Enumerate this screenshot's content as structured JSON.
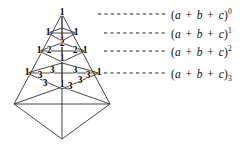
{
  "figure": {
    "background_color": "#ffffff",
    "line_color": "#333333",
    "text_color": "#111111"
  },
  "equation_labels": [
    {
      "id": "row-0",
      "base": "(a + b + c)",
      "exponent": "0",
      "exponent_style": "superscript",
      "x": 171,
      "y": 9
    },
    {
      "id": "row-1",
      "base": "(a + b + c)",
      "exponent": "1",
      "exponent_style": "superscript",
      "x": 171,
      "y": 28
    },
    {
      "id": "row-2",
      "base": "(a + b + c)",
      "exponent": "2",
      "exponent_style": "superscript",
      "x": 171,
      "y": 46
    },
    {
      "id": "row-3",
      "base": "(a + b + c)",
      "exponent": "3",
      "exponent_style": "subscript",
      "x": 171,
      "y": 68
    }
  ],
  "leader_lines": [
    {
      "id": "leader-0",
      "x1": 98,
      "x2": 167,
      "y": 14
    },
    {
      "id": "leader-1",
      "x1": 104,
      "x2": 167,
      "y": 33
    },
    {
      "id": "leader-2",
      "x1": 104,
      "x2": 167,
      "y": 51
    },
    {
      "id": "leader-3",
      "x1": 104,
      "x2": 167,
      "y": 73
    }
  ],
  "pyramid": {
    "apex": {
      "x": 62,
      "y": 14
    },
    "base_front": {
      "x": 62,
      "y": 139
    },
    "base_left": {
      "x": 14,
      "y": 104
    },
    "base_right": {
      "x": 110,
      "y": 104
    },
    "base_back": {
      "x": 62,
      "y": 87
    }
  },
  "coefficient_rows": [
    {
      "id": "level-0",
      "power": "0",
      "values": [
        {
          "text": "1",
          "x": 62,
          "y": 13
        }
      ]
    },
    {
      "id": "level-1",
      "power": "1",
      "values": [
        {
          "text": "1",
          "x": 48,
          "y": 33
        },
        {
          "text": "1",
          "x": 76,
          "y": 33
        },
        {
          "text": "1",
          "x": 62,
          "y": 41
        }
      ]
    },
    {
      "id": "level-2",
      "power": "2",
      "values": [
        {
          "text": "1",
          "x": 39,
          "y": 51
        },
        {
          "text": "2",
          "x": 49,
          "y": 51
        },
        {
          "text": "2",
          "x": 75,
          "y": 51
        },
        {
          "text": "1",
          "x": 85,
          "y": 51
        },
        {
          "text": "2",
          "x": 62,
          "y": 44
        },
        {
          "text": "1",
          "x": 62,
          "y": 59
        }
      ]
    },
    {
      "id": "level-3",
      "power": "3",
      "values": [
        {
          "text": "1",
          "x": 27,
          "y": 73
        },
        {
          "text": "3",
          "x": 40,
          "y": 76
        },
        {
          "text": "3",
          "x": 52,
          "y": 71
        },
        {
          "text": "3",
          "x": 75,
          "y": 71
        },
        {
          "text": "3",
          "x": 88,
          "y": 76
        },
        {
          "text": "1",
          "x": 99,
          "y": 73
        },
        {
          "text": "3",
          "x": 45,
          "y": 84
        },
        {
          "text": "1",
          "x": 62,
          "y": 85
        },
        {
          "text": "3",
          "x": 70,
          "y": 87
        },
        {
          "text": "3",
          "x": 80,
          "y": 81
        }
      ]
    }
  ]
}
